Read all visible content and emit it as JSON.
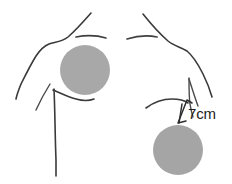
{
  "figure": {
    "name": "breast-lesion-measurement-diagram",
    "background_color": "#ffffff",
    "width": 232,
    "height": 184
  },
  "annotations": {
    "measurement_label": "7cm",
    "measurement_value": 7,
    "measurement_unit": "cm"
  },
  "colors": {
    "outline": "#3a3a3a",
    "lesion_fill": "#a8a8a8",
    "lesion_fill_right": "#a5a5a5",
    "text": "#1c1c1c",
    "background": "#ffffff"
  },
  "markings": [
    {
      "id": "left-lesion",
      "label": "left-shaded-lesion-circle",
      "cx": 85,
      "cy": 70,
      "r": 25,
      "fill": "#a8a8a8"
    },
    {
      "id": "right-lesion",
      "label": "right-shaded-lesion-circle",
      "cx": 178,
      "cy": 150,
      "r": 25,
      "fill": "#a5a5a5"
    }
  ],
  "anatomy_parts": [
    {
      "id": "left-neck-shoulder",
      "label": "left-neck-and-shoulder-contour"
    },
    {
      "id": "right-neck-shoulder",
      "label": "right-neck-and-shoulder-contour"
    },
    {
      "id": "left-clavicle",
      "label": "left-clavicle-line"
    },
    {
      "id": "right-clavicle",
      "label": "right-clavicle-line"
    },
    {
      "id": "left-arm",
      "label": "left-arm-contour"
    },
    {
      "id": "right-arm",
      "label": "right-arm-contour"
    },
    {
      "id": "left-inframammary-fold",
      "label": "left-inframammary-fold"
    },
    {
      "id": "right-inframammary-fold",
      "label": "right-inframammary-fold"
    },
    {
      "id": "sternum-midline",
      "label": "sternum-midline"
    }
  ]
}
